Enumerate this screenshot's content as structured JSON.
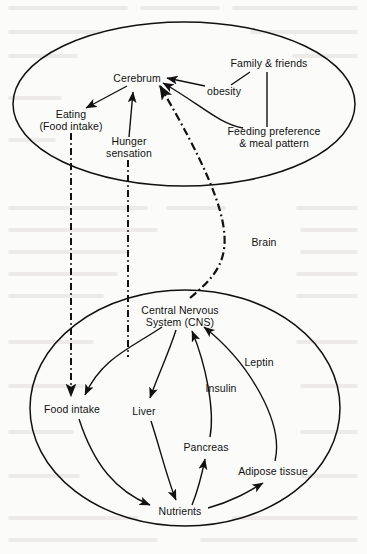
{
  "figure": {
    "type": "concept-diagram",
    "background_color": "#fbfbfa",
    "stroke_color": "#111111",
    "groups": [
      {
        "id": "brain-compartment",
        "name": "upper-ellipse",
        "cx": 184,
        "cy": 104,
        "rx": 171,
        "ry": 82
      },
      {
        "id": "body-compartment",
        "name": "lower-ellipse",
        "cx": 185,
        "cy": 408,
        "rx": 155,
        "ry": 118
      }
    ],
    "nodes": [
      {
        "id": "cerebrum",
        "label": "Cerebrum",
        "x": 137,
        "y": 79
      },
      {
        "id": "eating",
        "label": "Eating\n(Food intake)",
        "x": 71,
        "y": 120
      },
      {
        "id": "hunger",
        "label": "Hunger\nsensation",
        "x": 129,
        "y": 147
      },
      {
        "id": "family",
        "label": "Family & friends",
        "x": 269,
        "y": 64
      },
      {
        "id": "obesity",
        "label": "obesity",
        "x": 224,
        "y": 92
      },
      {
        "id": "feeding-pref",
        "label": "Feeding preference\n& meal pattern",
        "x": 274,
        "y": 137
      },
      {
        "id": "cns",
        "label": "Central Nervous\nSystem (CNS)",
        "x": 180,
        "y": 316
      },
      {
        "id": "food-intake",
        "label": "Food intake",
        "x": 72,
        "y": 410
      },
      {
        "id": "liver",
        "label": "Liver",
        "x": 144,
        "y": 412
      },
      {
        "id": "insulin",
        "label": "Insulin",
        "x": 221,
        "y": 389
      },
      {
        "id": "leptin",
        "label": "Leptin",
        "x": 259,
        "y": 363
      },
      {
        "id": "pancreas",
        "label": "Pancreas",
        "x": 206,
        "y": 448
      },
      {
        "id": "adipose",
        "label": "Adipose tissue",
        "x": 273,
        "y": 472
      },
      {
        "id": "nutrients",
        "label": "Nutrients",
        "x": 180,
        "y": 512
      },
      {
        "id": "brain-link",
        "label": "Brain",
        "x": 264,
        "y": 243
      }
    ],
    "edges": [
      {
        "from": "cerebrum",
        "to": "eating",
        "style": "solid",
        "arrow": "to"
      },
      {
        "from": "hunger",
        "to": "cerebrum",
        "style": "solid",
        "arrow": "to"
      },
      {
        "from": "obesity",
        "to": "cerebrum",
        "style": "solid",
        "arrow": "to"
      },
      {
        "from": "family",
        "to": "obesity",
        "style": "solid",
        "arrow": "none"
      },
      {
        "from": "family",
        "to": "feeding-pref",
        "style": "solid",
        "arrow": "none"
      },
      {
        "from": "feeding-pref",
        "to": "cerebrum",
        "style": "solid",
        "arrow": "to"
      },
      {
        "from": "eating",
        "to": "food-intake",
        "style": "dash-dot",
        "arrow": "to"
      },
      {
        "from": "hunger",
        "to": "cns",
        "style": "dash-dot",
        "arrow": "none"
      },
      {
        "from": "cns",
        "to": "cerebrum",
        "style": "dash-dot",
        "arrow": "to",
        "label": "Brain"
      },
      {
        "from": "cns",
        "to": "food-intake",
        "style": "solid",
        "arrow": "to"
      },
      {
        "from": "cns",
        "to": "liver",
        "style": "solid",
        "arrow": "to"
      },
      {
        "from": "food-intake",
        "to": "nutrients",
        "style": "solid",
        "arrow": "to"
      },
      {
        "from": "liver",
        "to": "nutrients",
        "style": "solid",
        "arrow": "to"
      },
      {
        "from": "nutrients",
        "to": "pancreas",
        "style": "solid",
        "arrow": "to"
      },
      {
        "from": "nutrients",
        "to": "adipose",
        "style": "solid",
        "arrow": "to"
      },
      {
        "from": "pancreas",
        "to": "cns",
        "style": "solid",
        "arrow": "to",
        "label": "Insulin"
      },
      {
        "from": "adipose",
        "to": "cns",
        "style": "solid",
        "arrow": "to",
        "label": "Leptin"
      }
    ]
  }
}
